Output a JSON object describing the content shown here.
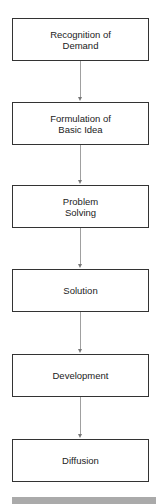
{
  "diagram": {
    "type": "flowchart",
    "direction": "top-to-bottom",
    "nodes": [
      {
        "id": "n1",
        "label": "Recognition of\nDemand",
        "lines": [
          "Recognition of",
          "Demand"
        ]
      },
      {
        "id": "n2",
        "label": "Formulation of\nBasic Idea",
        "lines": [
          "Formulation of",
          "Basic Idea"
        ]
      },
      {
        "id": "n3",
        "label": "Problem\nSolving",
        "lines": [
          "Problem",
          "Solving"
        ]
      },
      {
        "id": "n4",
        "label": "Solution",
        "lines": [
          "Solution"
        ]
      },
      {
        "id": "n5",
        "label": "Development",
        "lines": [
          "Development"
        ]
      },
      {
        "id": "n6",
        "label": "Diffusion",
        "lines": [
          "Diffusion"
        ]
      }
    ],
    "edges": [
      {
        "from": "n1",
        "to": "n2"
      },
      {
        "from": "n2",
        "to": "n3"
      },
      {
        "from": "n3",
        "to": "n4"
      },
      {
        "from": "n4",
        "to": "n5"
      },
      {
        "from": "n5",
        "to": "n6"
      }
    ],
    "colors": {
      "box_border": "#333333",
      "connector": "#a0a0a0",
      "footer_bar": "#aaaaaa"
    }
  }
}
